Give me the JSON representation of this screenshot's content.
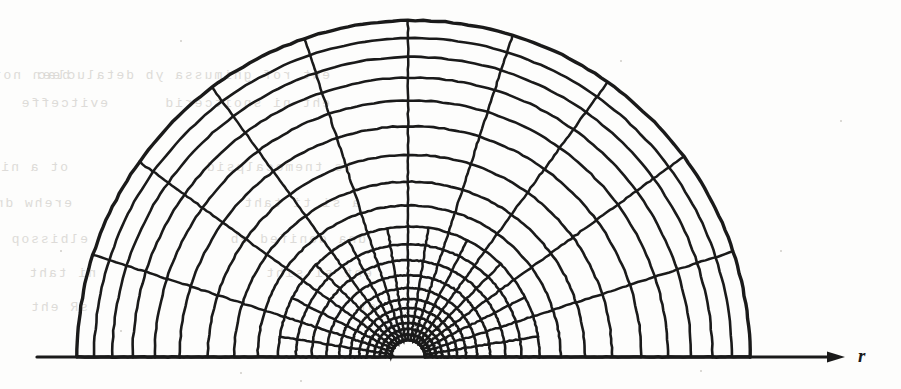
{
  "figure": {
    "kind": "scanned-figure",
    "background_color": "#fdfdfc",
    "ink_color": "#1a1a1a",
    "ghost_text_color": "#d8d6d2"
  },
  "axis": {
    "label": "r",
    "baseline_y": 357,
    "start_x": 37,
    "end_x": 845,
    "arrow_head": "right-arrow-icon",
    "color": "#1a1a1a",
    "stroke_width": 3.2
  },
  "chart_data": {
    "type": "mesh",
    "title": "",
    "xlabel": "r",
    "ylabel": "",
    "geometry": {
      "center_x": 408,
      "center_y": 357,
      "inner_radius": 17,
      "outer_radius_left": 331,
      "outer_radius_right": 342,
      "outer_radius_top": 339,
      "angle_start_deg": 0,
      "angle_end_deg": 180
    },
    "radial_rings": [
      17,
      22.5,
      28,
      34,
      41,
      49,
      58,
      69,
      82,
      97,
      113,
      131,
      152,
      176,
      203,
      232,
      258,
      281,
      302,
      321,
      339
    ],
    "angular_bands": [
      {
        "from_ring": 0,
        "to_ring": 6,
        "sectors": 20
      },
      {
        "from_ring": 6,
        "to_ring": 11,
        "sectors": 20
      },
      {
        "from_ring": 11,
        "to_ring": 15,
        "sectors": 10
      },
      {
        "from_ring": 15,
        "to_ring": 20,
        "sectors": 10
      }
    ],
    "sector_counts_note": "20 sectors in the refined inner annuli, halving to 10 across the de-refinement band",
    "grid": true,
    "legend": "none"
  },
  "ghost_text": {
    "note": "faint mirrored bleed-through from the reverse page",
    "lines": [
      {
        "x": 70,
        "y": 68,
        "text": "been not pne noitegaporp llaw"
      },
      {
        "x": 330,
        "y": 68,
        "text": "eht rof gnimussa yb detaluclac"
      },
      {
        "x": 108,
        "y": 96,
        "text": "evitceffe"
      },
      {
        "x": 330,
        "y": 96,
        "text": "eht ni snoitcerid"
      },
      {
        "x": 68,
        "y": 160,
        "text": "ot a ni noitulos eht setoned"
      },
      {
        "x": 352,
        "y": 160,
        "text": "ts tnemecalpsid"
      },
      {
        "x": 72,
        "y": 196,
        "text": "erehw dna llams eht ni"
      },
      {
        "x": 360,
        "y": 196,
        "text": "a si ti taht"
      },
      {
        "x": 88,
        "y": 232,
        "text": "elbissop"
      },
      {
        "x": 366,
        "y": 232,
        "text": "dna denifed eb"
      },
      {
        "x": 96,
        "y": 266,
        "text": "ni taht"
      },
      {
        "x": 372,
        "y": 266,
        "text": "eht si siht"
      },
      {
        "x": 88,
        "y": 300,
        "text": "sR eht"
      },
      {
        "x": 376,
        "y": 300,
        "text": "ot"
      }
    ]
  }
}
